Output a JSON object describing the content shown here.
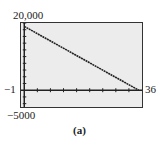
{
  "chart_data": {
    "type": "line",
    "title": "",
    "caption": "(a)",
    "xlabel": "",
    "ylabel": "",
    "xlim": [
      -1,
      36
    ],
    "ylim": [
      -5000,
      20000
    ],
    "x_tick_step": 4,
    "y_tick_step": 2000,
    "grid": false,
    "series": [
      {
        "name": "y",
        "x": [
          0,
          35
        ],
        "y": [
          19000,
          0
        ]
      }
    ],
    "window_labels": {
      "ymax": "20,000",
      "ymin": "−5000",
      "xmin": "−1",
      "xmax": "36"
    }
  }
}
